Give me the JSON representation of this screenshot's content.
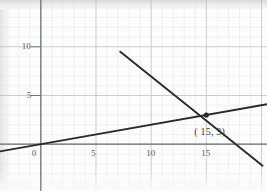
{
  "chart_data": {
    "type": "line",
    "title": "",
    "xlabel": "",
    "ylabel": "",
    "xlim": [
      -3.7,
      20.5
    ],
    "ylim": [
      -4.8,
      14.8
    ],
    "grid": true,
    "minor_grid": true,
    "minor_grid_step": 1,
    "major_grid_step": 5,
    "legend": "none",
    "x_ticks": [
      {
        "value": 0,
        "label": "0"
      },
      {
        "value": 5,
        "label": "5"
      },
      {
        "value": 10,
        "label": "10"
      },
      {
        "value": 15,
        "label": "15"
      }
    ],
    "y_ticks": [
      {
        "value": 5,
        "label": "5"
      },
      {
        "value": 10,
        "label": "10"
      }
    ],
    "series": [
      {
        "name": "shallow-ascending-line",
        "slope": 0.2,
        "intercept": 0,
        "points": [
          [
            -3.7,
            -0.74
          ],
          [
            20.5,
            4.1
          ]
        ]
      },
      {
        "name": "steep-descending-line",
        "slope": -0.83,
        "intercept": 15.45,
        "points": [
          [
            7.2,
            9.5
          ],
          [
            20.1,
            -2.2
          ]
        ]
      }
    ],
    "annotations": [
      {
        "name": "intersection",
        "x": 15,
        "y": 3,
        "label": "( 15, 3)",
        "marker": "dot"
      }
    ]
  },
  "colors": {
    "axis": "#6e6e6e",
    "grid_minor": "#e0e3e8",
    "grid_major": "#b9bfc8",
    "line": "#2b2b2b",
    "tick_text": "#5b5b5b",
    "annotation_text": "#3a3a3a",
    "paper": "#fdfdfd"
  }
}
